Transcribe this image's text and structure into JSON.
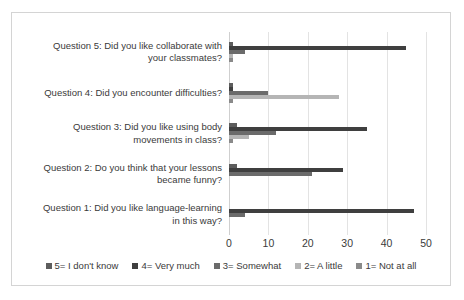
{
  "chart_data": {
    "type": "bar",
    "orientation": "horizontal",
    "title": "",
    "xlabel": "",
    "ylabel": "",
    "xlim": [
      0,
      50
    ],
    "xticks": [
      0,
      10,
      20,
      30,
      40,
      50
    ],
    "grid": true,
    "legend_position": "bottom",
    "categories": [
      "Question 5: Did you like collaborate with\nyour classmates?",
      "Question 4: Did you encounter difficulties?",
      "Question 3: Did you like using body\nmovements in class?",
      "Question 2: Do you think that your lessons\nbecame funny?",
      "Question 1: Did you like language-learning\nin this way?"
    ],
    "series": [
      {
        "name": "5= I don't know",
        "color": "#5d5d5d",
        "values": [
          1,
          1,
          2,
          2,
          0
        ]
      },
      {
        "name": "4= Very much",
        "color": "#3f3f3f",
        "values": [
          45,
          1,
          35,
          29,
          47
        ]
      },
      {
        "name": "3= Somewhat",
        "color": "#6b6b6b",
        "values": [
          4,
          10,
          12,
          21,
          4
        ]
      },
      {
        "name": "2= A little",
        "color": "#b5b5b5",
        "values": [
          1,
          28,
          5,
          0,
          0
        ]
      },
      {
        "name": "1= Not at all",
        "color": "#8a8a8a",
        "values": [
          1,
          1,
          1,
          0,
          0
        ]
      }
    ]
  },
  "axis": {
    "tick_labels": [
      "0",
      "10",
      "20",
      "30",
      "40",
      "50"
    ]
  },
  "legend": {
    "items": [
      {
        "label": "5= I don't know",
        "color": "#5d5d5d"
      },
      {
        "label": "4= Very much",
        "color": "#3f3f3f"
      },
      {
        "label": "3= Somewhat",
        "color": "#6b6b6b"
      },
      {
        "label": "2= A little",
        "color": "#b5b5b5"
      },
      {
        "label": "1= Not at all",
        "color": "#8a8a8a"
      }
    ]
  }
}
